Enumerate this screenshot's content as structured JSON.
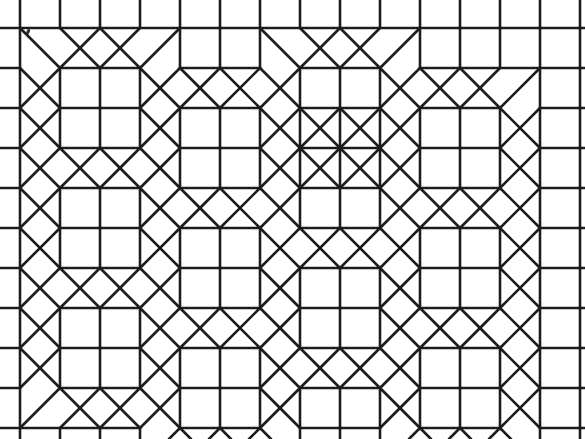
{
  "figure": {
    "kind": "mesh-diagram",
    "background_color": "#ffffff",
    "line_color": "#1c1c1c",
    "line_width_px": 2.6,
    "canvas": {
      "width": 585,
      "height": 439
    },
    "grid": {
      "spacing_px": 40,
      "origin_x": 20,
      "origin_y": 28,
      "columns": 14,
      "rows": 10
    },
    "legend_present": false,
    "axes_present": false,
    "labels_present": false
  },
  "chart_data": {
    "type": "diagram",
    "xlabel": "",
    "ylabel": "",
    "grid_spacing": 40,
    "macro_block_size_cells": 2,
    "macro_blocks": [
      {
        "col": 1,
        "row": 1
      },
      {
        "col": 4,
        "row": 2
      },
      {
        "col": 7,
        "row": 1
      },
      {
        "col": 7,
        "row": 3
      },
      {
        "col": 10,
        "row": 2
      },
      {
        "col": 1,
        "row": 4
      },
      {
        "col": 4,
        "row": 5
      },
      {
        "col": 7,
        "row": 6
      },
      {
        "col": 10,
        "row": 5
      },
      {
        "col": 1,
        "row": 7
      },
      {
        "col": 4,
        "row": 8
      },
      {
        "col": 10,
        "row": 8
      }
    ],
    "element_types": [
      "quadrilateral",
      "triangle"
    ]
  }
}
